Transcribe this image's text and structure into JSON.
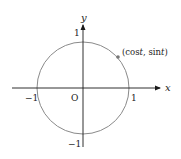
{
  "diagram": {
    "type": "unit-circle",
    "axes": {
      "x_label": "x",
      "y_label": "y",
      "origin_label": "O"
    },
    "ticks": {
      "x_neg": "−1",
      "x_pos": "1",
      "y_pos": "1",
      "y_neg": "−1"
    },
    "point": {
      "label_open": "(cos",
      "label_t1": "t",
      "label_mid": ", sin",
      "label_t2": "t",
      "label_close": ")"
    },
    "colors": {
      "circle": "#8a8a8a",
      "axes": "#1a1a1a",
      "point": "#777777"
    }
  }
}
